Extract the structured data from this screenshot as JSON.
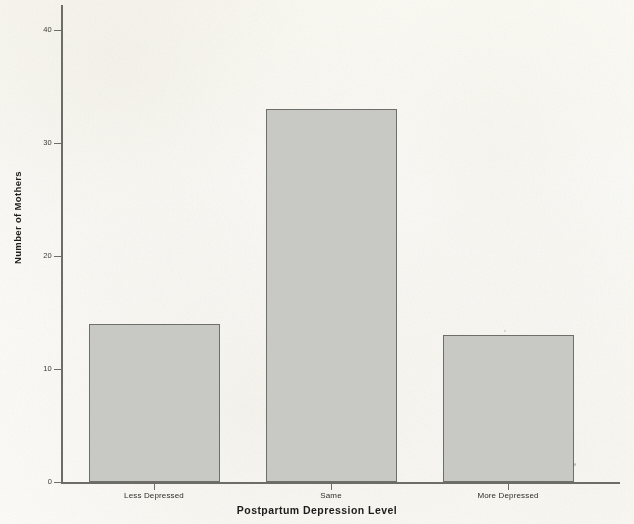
{
  "chart_data": {
    "type": "bar",
    "title": "",
    "subtitle": "",
    "xlabel": "Postpartum Depression Level",
    "ylabel": "Number of Mothers",
    "categories": [
      "Less Depressed",
      "Same",
      "More Depressed"
    ],
    "values": [
      14,
      33,
      13
    ],
    "series": [
      {
        "name": "Number of Mothers",
        "values": [
          14,
          33,
          13
        ]
      }
    ],
    "ylim": [
      0,
      42
    ],
    "yticks": [
      0,
      10,
      20,
      30,
      40
    ],
    "ytick_labels": [
      "0",
      "10",
      "20",
      "30",
      "40"
    ],
    "xtick_labels": [
      "Less Depressed",
      "Same",
      "More Depressed"
    ],
    "grid": false,
    "legend": false,
    "legend_position": "none",
    "bar_fill_color": "#c8c8c4",
    "bar_edge_color": "#6f6f6a",
    "axis_color": "#6d6d68",
    "background_color": "#fdfcf8",
    "text_color": "#1c1c1a",
    "annotations": []
  },
  "axes": {
    "y_title": "Number of Mothers",
    "x_title": "Postpartum Depression Level"
  }
}
